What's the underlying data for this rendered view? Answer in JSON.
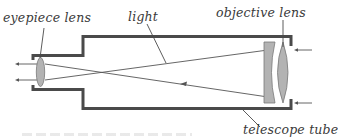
{
  "diagram": {
    "labels": {
      "eyepiece": "eyepiece lens",
      "light": "light",
      "objective": "objective lens",
      "tube": "telescope tube"
    },
    "colors": {
      "tube_outline": "#4a4a4a",
      "lens_fill": "#b3b3b3",
      "ray": "#555555",
      "label_text": "#3a3a3a"
    }
  }
}
